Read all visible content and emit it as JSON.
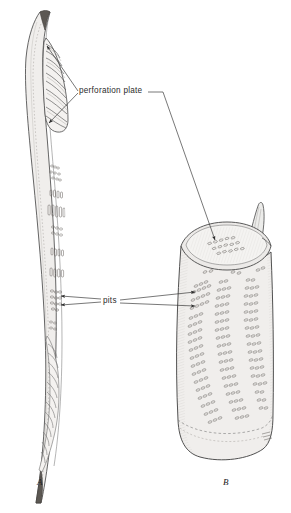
{
  "figure": {
    "background_color": "#ffffff",
    "ink_color": "#3a3a3a",
    "fill_color": "#f0eeec",
    "shade_color": "#d8d4d0",
    "panels": [
      {
        "id": "A",
        "label": "A",
        "description": "Long narrow vessel element in side view, tapering at both ends, with scalariform perforation plates near each end and clustered pits along the lateral wall"
      },
      {
        "id": "B",
        "label": "B",
        "description": "Short wide barrel-shaped vessel element in three-quarter view, open perforation plate forming an elliptical rim at the top, pointed tail projection at upper right, diagonal rows of oval pits on the body wall"
      }
    ],
    "callouts": [
      {
        "id": "perforation-plate",
        "text": "perforation plate",
        "targets": [
          "panel-a-upper-plate",
          "panel-a-lower-plate",
          "panel-b-top-plate"
        ],
        "arrow_count": 3
      },
      {
        "id": "pits",
        "text": "pits",
        "targets": [
          "panel-a-pit-cluster-upper",
          "panel-a-pit-cluster-lower",
          "panel-b-pit-row-upper",
          "panel-b-pit-row-lower"
        ],
        "arrow_count": 4
      }
    ],
    "signature": {
      "present": true,
      "text": "",
      "description": "small illegible artist monogram near lower right of panel B"
    }
  }
}
